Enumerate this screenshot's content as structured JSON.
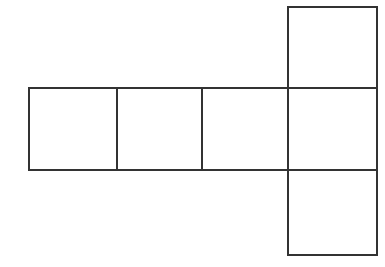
{
  "figure": {
    "kind": "cube-net-diagram",
    "face_count": 6,
    "background_color": "#ffffff",
    "line_color": "#333333",
    "line_width_px": 2,
    "canvas": {
      "width": 385,
      "height": 267
    },
    "square_size_px": {
      "width": 87,
      "height": 82
    },
    "grid": {
      "columns_x": [
        29,
        117,
        202,
        288,
        377
      ],
      "rows_y": [
        7,
        88,
        170,
        255
      ]
    },
    "faces": [
      {
        "id": "face-row-1",
        "label": "",
        "x": 29,
        "y": 88,
        "width": 88,
        "height": 82,
        "row": "middle",
        "column": 1
      },
      {
        "id": "face-row-2",
        "label": "",
        "x": 117,
        "y": 88,
        "width": 85,
        "height": 82,
        "row": "middle",
        "column": 2
      },
      {
        "id": "face-row-3",
        "label": "",
        "x": 202,
        "y": 88,
        "width": 86,
        "height": 82,
        "row": "middle",
        "column": 3
      },
      {
        "id": "face-row-4",
        "label": "",
        "x": 288,
        "y": 88,
        "width": 89,
        "height": 82,
        "row": "middle",
        "column": 4
      },
      {
        "id": "face-top",
        "label": "",
        "x": 288,
        "y": 7,
        "width": 89,
        "height": 81,
        "row": "top",
        "column": 4
      },
      {
        "id": "face-bottom",
        "label": "",
        "x": 288,
        "y": 170,
        "width": 89,
        "height": 85,
        "row": "bottom",
        "column": 4
      }
    ]
  }
}
